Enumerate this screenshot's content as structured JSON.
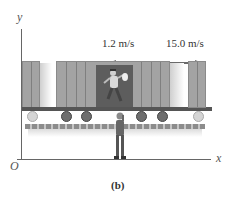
{
  "figure": {
    "axes": {
      "y_label": "y",
      "x_label": "x",
      "origin_label": "O"
    },
    "velocity_labels": {
      "runner": "1.2 m/s",
      "train": "15.0 m/s"
    },
    "caption": "(b)"
  },
  "colors": {
    "axis": "#555555",
    "car": "#a3a3a3",
    "door": "#5d5d5d",
    "arrow": "#6a6a6a",
    "track": "#8c8c8c"
  }
}
